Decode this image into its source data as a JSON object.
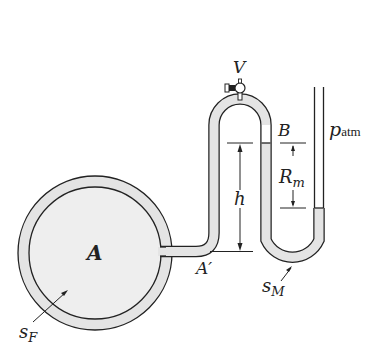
{
  "diagram": {
    "type": "manometer",
    "colors": {
      "fluid_fill": "#e4e4e4",
      "stroke": "#222222",
      "background": "#ffffff"
    },
    "labels": {
      "valve": "V",
      "point_b": "B",
      "atm_p": "p",
      "atm_sub": "atm",
      "reading_r": "R",
      "reading_sub": "m",
      "height": "h",
      "tank": "A",
      "point_a_prime": "A′",
      "manometer_fluid_s": "s",
      "manometer_fluid_sub": "M",
      "tank_fluid_s": "s",
      "tank_fluid_sub": "F"
    }
  }
}
